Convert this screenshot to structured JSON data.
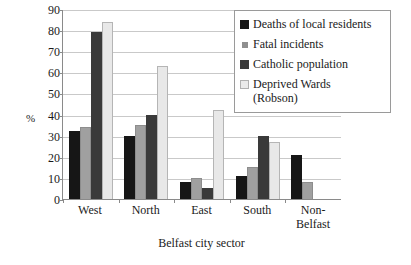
{
  "chart_data": {
    "type": "bar",
    "title": "",
    "xlabel": "Belfast city sector",
    "ylabel": "%",
    "ylim": [
      0,
      90
    ],
    "yticks": [
      0,
      10,
      20,
      30,
      40,
      50,
      60,
      70,
      80,
      90
    ],
    "grid": true,
    "legend_position": "top-right",
    "categories": [
      "West",
      "North",
      "East",
      "South",
      "Non-Belfast"
    ],
    "series": [
      {
        "name": "Deaths of local residents",
        "color": "#161616",
        "values": [
          32,
          30,
          8,
          11,
          21
        ]
      },
      {
        "name": "Fatal incidents",
        "color": "#a0a0a0",
        "values": [
          34,
          35,
          10,
          15,
          8
        ]
      },
      {
        "name": "Catholic population",
        "color": "#3a3a3a",
        "values": [
          79,
          40,
          5,
          30,
          null
        ]
      },
      {
        "name": "Deprived Wards (Robson)",
        "color": "#e8e8e8",
        "values": [
          84,
          63,
          42,
          27,
          null
        ]
      }
    ]
  },
  "axes": {
    "y_title": "%",
    "x_title": "Belfast city sector"
  },
  "legend": {
    "entries": [
      {
        "label": "Deaths of local residents"
      },
      {
        "label": "Fatal incidents"
      },
      {
        "label": "Catholic population"
      },
      {
        "label": "Deprived Wards (Robson)"
      }
    ]
  },
  "x_labels": [
    "West",
    "North",
    "East",
    "South",
    "Non-Belfast"
  ]
}
